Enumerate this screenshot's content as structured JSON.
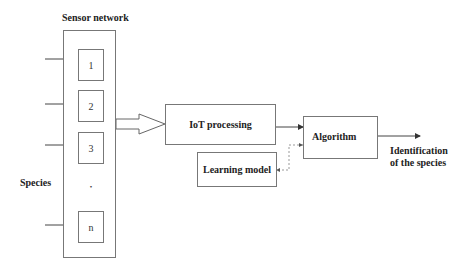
{
  "diagram": {
    "sensor_network": {
      "title": "Sensor network",
      "sensors": [
        {
          "label": "1"
        },
        {
          "label": "2"
        },
        {
          "label": "3"
        },
        {
          "label": "n"
        }
      ],
      "ellipsis": "•"
    },
    "species_label": "Species",
    "iot_processing": {
      "label": "IoT processing"
    },
    "learning_model": {
      "label": "Learning model"
    },
    "algorithm": {
      "label": "Algorithm"
    },
    "output": {
      "line1": "Identification",
      "line2": "of the species"
    },
    "colors": {
      "line": "#444444",
      "box_border": "#777777",
      "text": "#222222",
      "dashed": "#999999"
    }
  }
}
